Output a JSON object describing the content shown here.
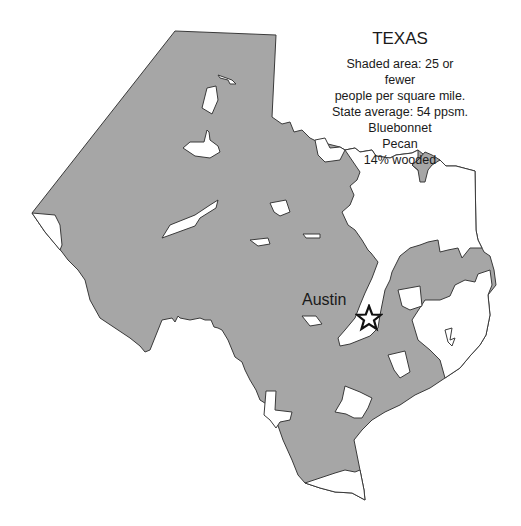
{
  "map": {
    "state_name": "TEXAS",
    "legend_lines": [
      "Shaded area: 25 or fewer",
      "people per square mile.",
      "State average: 54 ppsm.",
      "Bluebonnet",
      "Pecan",
      "14% wooded"
    ],
    "capital": {
      "name": "Austin",
      "marker": "star-icon"
    },
    "colors": {
      "shaded": "#a6a6a6",
      "unshaded": "#ffffff",
      "outline": "#3a3a3a"
    }
  }
}
